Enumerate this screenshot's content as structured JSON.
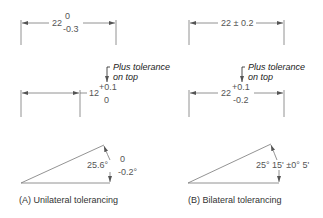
{
  "panel_a": {
    "caption": "(A) Unilateral tolerancing",
    "dim1": {
      "base": "22",
      "upper": "0",
      "lower": "-0.3"
    },
    "dim2": {
      "base": "12",
      "upper": "+0.1",
      "lower": "0"
    },
    "note_line1": "Plus tolerance",
    "note_line2": "on top",
    "angle": {
      "base": "25.6°",
      "upper": "0",
      "lower": "-0.2°"
    }
  },
  "panel_b": {
    "caption": "(B) Bilateral tolerancing",
    "dim1": {
      "text": "22 ± 0.2"
    },
    "dim2": {
      "base": "22",
      "upper": "+0.1",
      "lower": "-0.2"
    },
    "note_line1": "Plus tolerance",
    "note_line2": "on top",
    "angle": {
      "text": "25° 15' ±0° 5'"
    }
  }
}
